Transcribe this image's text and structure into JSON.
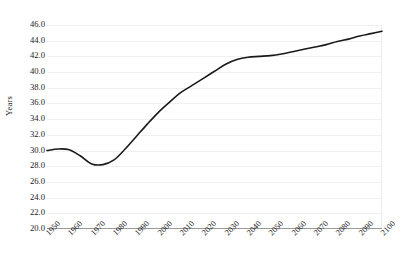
{
  "chart_data": {
    "type": "line",
    "title": "",
    "subtitle": "",
    "xlabel": "",
    "ylabel": "Years",
    "xlim": [
      1950,
      2100
    ],
    "ylim": [
      20.0,
      46.0
    ],
    "grid": true,
    "legend": false,
    "legend_position": "none",
    "line_color": "#1a1a1a",
    "grid_color": "#f0f0f0",
    "axis_color": "#9a9a9a",
    "background_color": "#ffffff",
    "y_ticks": [
      "46.0",
      "44.0",
      "42.0",
      "40.0",
      "38.0",
      "36.0",
      "34.0",
      "32.0",
      "30.0",
      "28.0",
      "26.0",
      "24.0",
      "22.0",
      "20.0"
    ],
    "x_ticks": [
      "1950",
      "1960",
      "1970",
      "1980",
      "1990",
      "2000",
      "2010",
      "2020",
      "2030",
      "2040",
      "2050",
      "2060",
      "2070",
      "2080",
      "2090",
      "2100"
    ],
    "x": [
      1950,
      1955,
      1960,
      1965,
      1970,
      1975,
      1980,
      1985,
      1990,
      1995,
      2000,
      2005,
      2010,
      2015,
      2020,
      2025,
      2030,
      2035,
      2040,
      2045,
      2050,
      2055,
      2060,
      2065,
      2070,
      2075,
      2080,
      2085,
      2090,
      2095,
      2100
    ],
    "values": [
      30.0,
      30.2,
      30.1,
      29.3,
      28.3,
      28.2,
      28.8,
      30.2,
      31.8,
      33.4,
      34.9,
      36.2,
      37.4,
      38.3,
      39.2,
      40.1,
      41.0,
      41.6,
      41.9,
      42.0,
      42.1,
      42.3,
      42.6,
      42.9,
      43.2,
      43.5,
      43.9,
      44.2,
      44.6,
      44.9,
      45.2
    ],
    "series": [
      {
        "name": "Median age",
        "values": [
          30.0,
          30.2,
          30.1,
          29.3,
          28.3,
          28.2,
          28.8,
          30.2,
          31.8,
          33.4,
          34.9,
          36.2,
          37.4,
          38.3,
          39.2,
          40.1,
          41.0,
          41.6,
          41.9,
          42.0,
          42.1,
          42.3,
          42.6,
          42.9,
          43.2,
          43.5,
          43.9,
          44.2,
          44.6,
          44.9,
          45.2
        ]
      }
    ],
    "annotations": []
  }
}
